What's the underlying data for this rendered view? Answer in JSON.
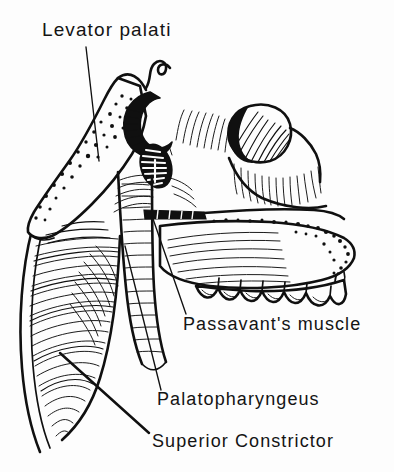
{
  "figure": {
    "kind": "anatomical-line-drawing",
    "background_color": "#fdfdfd",
    "ink_color": "#101010"
  },
  "labels": [
    {
      "id": "levator-palati",
      "text": "Levator palati",
      "x": 42,
      "y": 36,
      "leader": {
        "x1": 86,
        "y1": 47,
        "x2": 99,
        "y2": 161
      }
    },
    {
      "id": "passavants-muscle",
      "text": "Passavant's muscle",
      "x": 183,
      "y": 330,
      "leader": {
        "x1": 152,
        "y1": 216,
        "x2": 186,
        "y2": 314
      }
    },
    {
      "id": "palatopharyngeus",
      "text": "Palatopharyngeus",
      "x": 157,
      "y": 405,
      "leader": {
        "x1": 125,
        "y1": 246,
        "x2": 161,
        "y2": 390
      }
    },
    {
      "id": "superior-constrictor",
      "text": "Superior Constrictor",
      "x": 152,
      "y": 447,
      "leader": {
        "x1": 60,
        "y1": 353,
        "x2": 149,
        "y2": 433
      }
    }
  ],
  "structures": [
    {
      "id": "sphenoid-bone-plate",
      "name": "stippled bone plate",
      "region": "upper-left"
    },
    {
      "id": "pterygoid-hamulus",
      "name": "hamulus hook",
      "region": "upper-center"
    },
    {
      "id": "levator-opening",
      "name": "hatched oval opening",
      "region": "center-upper"
    },
    {
      "id": "torus-tubarius",
      "name": "rounded hatched mass",
      "region": "upper-right"
    },
    {
      "id": "passavant-ridge",
      "name": "dark transverse band",
      "region": "center"
    },
    {
      "id": "soft-palate",
      "name": "soft palate with stippled margin",
      "region": "right"
    },
    {
      "id": "tooth-row",
      "name": "maxillary teeth",
      "region": "lower-right",
      "count": 6
    },
    {
      "id": "superior-constrictor-muscle",
      "name": "curved hatched muscle sheet",
      "region": "lower-left"
    },
    {
      "id": "palatopharyngeus-muscle",
      "name": "descending striated band",
      "region": "center-lower"
    }
  ]
}
